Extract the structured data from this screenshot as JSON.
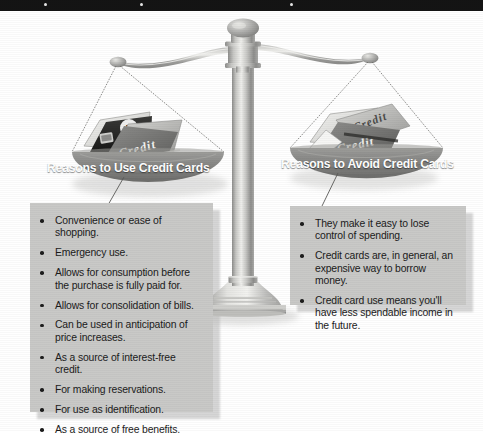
{
  "figure": {
    "background_color": "#ffffff",
    "top_band_color": "#141414",
    "pan_color": "#8a8a8a",
    "callout_color": "#c9c9c7",
    "text_color": "#1b1b1b",
    "pan_title_color": "#ffffff",
    "card_label": "Credit"
  },
  "left": {
    "pan_title": "Reasons to Use Credit Cards",
    "items": [
      "Convenience or ease of shopping.",
      "Emergency use.",
      "Allows for consumption before the purchase is fully paid for.",
      "Allows for consolidation of bills.",
      "Can be used in anticipation of price increases.",
      "As a source of interest-free credit.",
      "For making reservations.",
      "For use as identification.",
      "As a source of free benefits."
    ]
  },
  "right": {
    "pan_title": "Reasons to Avoid Credit Cards",
    "items": [
      "They make it easy to lose control of spending.",
      "Credit cards are, in general, an expensive way to borrow money.",
      "Credit card use means you'll have less spendable income in the future."
    ]
  }
}
